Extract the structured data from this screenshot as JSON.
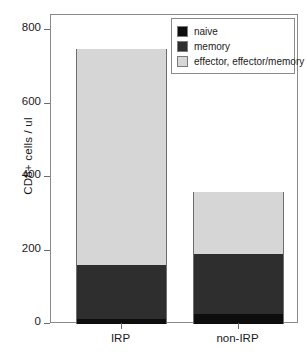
{
  "chart_data": {
    "type": "bar",
    "subtype": "stacked",
    "title": "",
    "xlabel": "",
    "ylabel": "CD8+ cells / ul",
    "categories": [
      "IRP",
      "non-IRP"
    ],
    "ylim": [
      0,
      800
    ],
    "yticks": [
      0,
      200,
      400,
      600,
      800
    ],
    "ytick_labels": [
      "0",
      "200",
      "400",
      "600",
      "800"
    ],
    "grid": false,
    "legend_position": "top-right",
    "series": [
      {
        "name": "naive",
        "color": "#0d0d0d",
        "values": [
          14,
          27
        ]
      },
      {
        "name": "memory",
        "color": "#2e2e2e",
        "values": [
          146,
          164
        ]
      },
      {
        "name": "effector, effector/memory",
        "color": "#d6d6d6",
        "values": [
          588,
          169
        ]
      }
    ],
    "totals": [
      748,
      360
    ]
  },
  "axis": {
    "y_title": "CD8+ cells / ul"
  },
  "legend": {
    "entries": [
      {
        "label": "naive",
        "color": "#0d0d0d"
      },
      {
        "label": "memory",
        "color": "#2e2e2e"
      },
      {
        "label": "effector, effector/memory",
        "color": "#d6d6d6"
      }
    ]
  }
}
